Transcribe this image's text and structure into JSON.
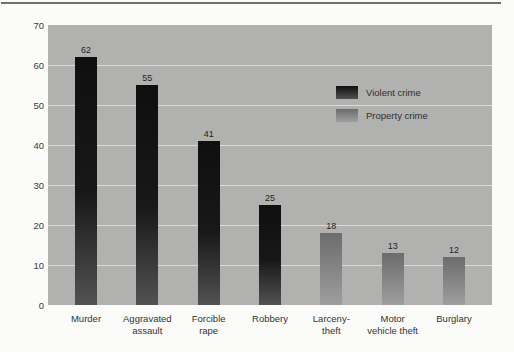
{
  "figure": {
    "top_rule_color": "#6f6f6f",
    "page_background": "#fbfbf9"
  },
  "chart_data": {
    "type": "bar",
    "title": "",
    "xlabel": "",
    "ylabel": "",
    "categories": [
      "Murder",
      "Aggravated assault",
      "Forcible rape",
      "Robbery",
      "Larceny-theft",
      "Motor vehicle theft",
      "Burglary"
    ],
    "category_label_lines": [
      [
        "Murder"
      ],
      [
        "Aggravated",
        "assault"
      ],
      [
        "Forcible",
        "rape"
      ],
      [
        "Robbery"
      ],
      [
        "Larceny-",
        "theft"
      ],
      [
        "Motor",
        "vehicle theft"
      ],
      [
        "Burglary"
      ]
    ],
    "values": [
      62,
      55,
      41,
      25,
      18,
      13,
      12
    ],
    "value_labels": [
      "62",
      "55",
      "41",
      "25",
      "18",
      "13",
      "12"
    ],
    "bar_groups": [
      "violent",
      "violent",
      "violent",
      "violent",
      "property",
      "property",
      "property"
    ],
    "series": [
      {
        "name": "Violent crime",
        "group": "violent",
        "values": [
          62,
          55,
          41,
          25,
          null,
          null,
          null
        ]
      },
      {
        "name": "Property crime",
        "group": "property",
        "values": [
          null,
          null,
          null,
          null,
          18,
          13,
          12
        ]
      }
    ],
    "ylim": [
      0,
      70
    ],
    "yticks": [
      0,
      10,
      20,
      30,
      40,
      50,
      60,
      70
    ],
    "grid": "horizontal-white-lines-behind-bars",
    "legend": {
      "position": "inside-upper-right",
      "entries": [
        {
          "label": "Violent crime",
          "group": "violent"
        },
        {
          "label": "Property crime",
          "group": "property"
        }
      ]
    },
    "colors": {
      "plot_background": "#b1b1af",
      "gridline": "#dadad7",
      "violent_top": "#0f0f0f",
      "violent_mid": "#181818",
      "violent_bottom": "#525252",
      "property_top": "#6c6c6c",
      "property_bottom": "#9e9e9e",
      "text": "#2f2f2f"
    }
  }
}
